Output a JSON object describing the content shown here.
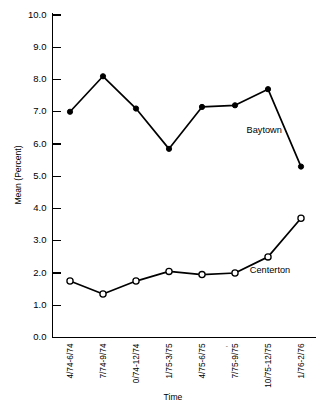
{
  "chart_data": {
    "type": "line",
    "title": "",
    "xlabel": "Time",
    "ylabel": "Mean (Percent)",
    "ylim": [
      0.0,
      10.0
    ],
    "ytick_labels": [
      "0.0",
      "1.0",
      "2.0",
      "3.0",
      "4.0",
      "5.0",
      "6.0",
      "7.0",
      "8.0",
      "9.0",
      "10.0"
    ],
    "ytick_values": [
      0.0,
      1.0,
      2.0,
      3.0,
      4.0,
      5.0,
      6.0,
      7.0,
      8.0,
      9.0,
      10.0
    ],
    "grid": false,
    "legend_position": "inline-annotation",
    "categories": [
      "4/74-6/74",
      "7/74-9/74",
      "0/74-12/74",
      "1/75-3/75",
      "4/75-6/75",
      "7/75-9/75",
      "10/75-12/75",
      "1/76-2/76"
    ],
    "series": [
      {
        "name": "Baytown",
        "marker": "filled-circle",
        "values": [
          7.0,
          8.1,
          7.1,
          5.85,
          7.15,
          7.2,
          7.7,
          5.3
        ]
      },
      {
        "name": "Centerton",
        "marker": "open-circle",
        "values": [
          1.75,
          1.35,
          1.75,
          2.05,
          1.95,
          2.0,
          2.5,
          3.7
        ]
      }
    ],
    "annotations": [
      {
        "text": "Baytown",
        "x_index": 5.35,
        "y_value": 6.35
      },
      {
        "text": "Centerton",
        "x_index": 5.45,
        "y_value": 2.0
      }
    ],
    "scan_artifacts": [
      {
        "text": "'",
        "near_category_index": 5
      }
    ]
  }
}
